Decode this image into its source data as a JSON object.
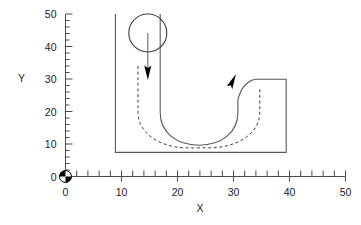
{
  "figure": {
    "title": "",
    "background_color": "#ffffff",
    "line_color": "#585858",
    "text_color": "#1a1a1a"
  },
  "chart_data": {
    "type": "line",
    "title": "",
    "xlabel": "X",
    "ylabel": "Y",
    "xlim": [
      0,
      50
    ],
    "ylim": [
      0,
      50
    ],
    "grid": false,
    "legend": "none",
    "x_major_ticks": [
      0,
      10,
      20,
      30,
      40,
      50
    ],
    "y_major_ticks": [
      0,
      10,
      20,
      30,
      40,
      50
    ],
    "x_tick_labels": [
      "0",
      "10",
      "20",
      "30",
      "40",
      "50"
    ],
    "y_tick_labels": [
      "0",
      "10",
      "20",
      "30",
      "40",
      "50"
    ],
    "x_minor_tick_step": 2,
    "y_minor_tick_step": 2,
    "annotations": [
      {
        "name": "origin-centroid-marker",
        "x": 0,
        "y": 0,
        "shape": "quartered-circle"
      },
      {
        "name": "inlet-circle",
        "cx": 17.5,
        "cy": 43.5,
        "r": 5.6,
        "shape": "circle"
      },
      {
        "name": "inlet-flow-arrow",
        "x": 17.5,
        "y_from": 43.5,
        "y_to": 29.5,
        "direction": "down"
      },
      {
        "name": "outlet-flow-arrow",
        "x": 33.0,
        "y_from": 20.0,
        "y_to": 30.0,
        "direction": "up-right"
      }
    ],
    "series": [
      {
        "name": "outer-wall",
        "style": "solid",
        "description": "U-shaped channel outer boundary",
        "points": [
          [
            9.0,
            50.0
          ],
          [
            9.0,
            10.0
          ],
          [
            39.5,
            10.0
          ],
          [
            39.5,
            30.0
          ],
          [
            34.0,
            30.0
          ]
        ]
      },
      {
        "name": "inner-wall",
        "style": "solid",
        "description": "U-shaped channel inner boundary (bend)",
        "points": [
          [
            17.0,
            50.0
          ],
          [
            17.0,
            26.0
          ],
          [
            24.0,
            15.5
          ],
          [
            31.5,
            26.0
          ],
          [
            34.0,
            30.0
          ]
        ]
      },
      {
        "name": "channel-centerline",
        "style": "dashed",
        "description": "Dashed centerline of flow through the bend",
        "points": [
          [
            13.0,
            34.0
          ],
          [
            13.0,
            24.0
          ],
          [
            17.5,
            17.0
          ],
          [
            24.0,
            15.0
          ],
          [
            30.5,
            18.0
          ],
          [
            33.0,
            24.0
          ],
          [
            33.0,
            29.0
          ]
        ]
      }
    ]
  }
}
